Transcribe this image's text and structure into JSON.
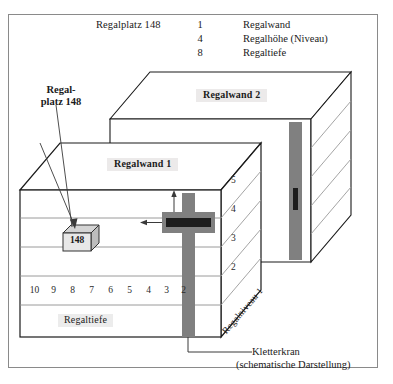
{
  "diagram": {
    "legend": {
      "title": "Regalplatz 148",
      "rows": [
        {
          "num": "1",
          "label": "Regalwand"
        },
        {
          "num": "4",
          "label": "Regalhöhe (Niveau)"
        },
        {
          "num": "8",
          "label": "Regaltiefe"
        }
      ]
    },
    "callout": {
      "line1": "Regal-",
      "line2": "platz 148"
    },
    "walls": [
      {
        "name": "Regalwand 1"
      },
      {
        "name": "Regalwand 2"
      }
    ],
    "bin": {
      "number": "148"
    },
    "levels": [
      "5",
      "4",
      "3",
      "2"
    ],
    "depths": [
      "10",
      "9",
      "8",
      "7",
      "6",
      "5",
      "4",
      "3",
      "2"
    ],
    "depth_label": "Regaltiefe",
    "niveau_label": "Regalniveau 1",
    "crane": {
      "title": "Kletterkran",
      "subtitle": "(schematische Darstellung)"
    },
    "colors": {
      "crane_mast": "#808080",
      "crane_fork": "#262626",
      "outline": "#1a1a1a",
      "shelf_line": "#8e8e8e",
      "label_bg": "#eceaea",
      "frame": "#8a8a8a"
    }
  }
}
